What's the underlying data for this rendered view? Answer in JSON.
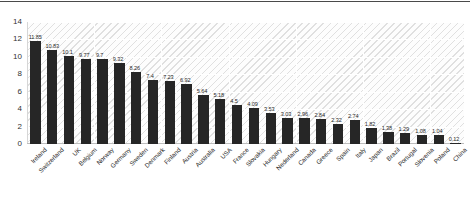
{
  "chart_data": {
    "type": "bar",
    "title": "",
    "subtitle": "",
    "xlabel": "",
    "ylabel": "",
    "ylim": [
      0,
      14
    ],
    "yticks": [
      0,
      2,
      4,
      6,
      8,
      10,
      12,
      14
    ],
    "grid": true,
    "legend": false,
    "legend_position": "none",
    "bar_color": "#262626",
    "show_value_labels": true,
    "categories": [
      "Ireland",
      "Switzerland",
      "UK",
      "Belgium",
      "Norway",
      "Germany",
      "Sweden",
      "Denmark",
      "Finland",
      "Austria",
      "Australia",
      "USA",
      "France",
      "Slovakia",
      "Hungary",
      "Nederland",
      "Canada",
      "Greece",
      "Spain",
      "Italy",
      "Japan",
      "Brazil",
      "Portugal",
      "Slovenia",
      "Poland",
      "China"
    ],
    "values": [
      11.85,
      10.83,
      10.1,
      9.77,
      9.7,
      9.32,
      8.26,
      7.4,
      7.23,
      6.92,
      5.64,
      5.18,
      4.5,
      4.09,
      3.53,
      3.03,
      2.96,
      2.84,
      2.32,
      2.74,
      1.82,
      1.38,
      1.29,
      1.08,
      1.04,
      0.12
    ],
    "value_labels": [
      "11.85",
      "10.83",
      "10.1",
      "9.77",
      "9.7",
      "9.32",
      "8.26",
      "7.4",
      "7.23",
      "6.92",
      "5.64",
      "5.18",
      "4.5",
      "4.09",
      "3.53",
      "3.03",
      "2.96",
      "2.84",
      "2.32",
      "2.74",
      "1.82",
      "1.38",
      "1.29",
      "1.08",
      "1.04",
      "0.12"
    ]
  }
}
